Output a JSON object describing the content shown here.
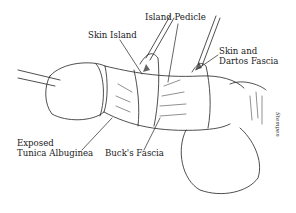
{
  "diagram": {
    "type": "medical-illustration",
    "labels": {
      "island_pedicle": "Island Pedicle",
      "skin_island": "Skin Island",
      "skin_and_dartos_line1": "Skin and",
      "skin_and_dartos_line2": "Dartos Fascia",
      "exposed_tunica_line1": "Exposed",
      "exposed_tunica_line2": "Tunica Albuginea",
      "bucks_fascia": "Buck's Fascia"
    },
    "signature": "Stempen",
    "colors": {
      "ink": "#1a1a1a",
      "background": "#ffffff"
    }
  }
}
